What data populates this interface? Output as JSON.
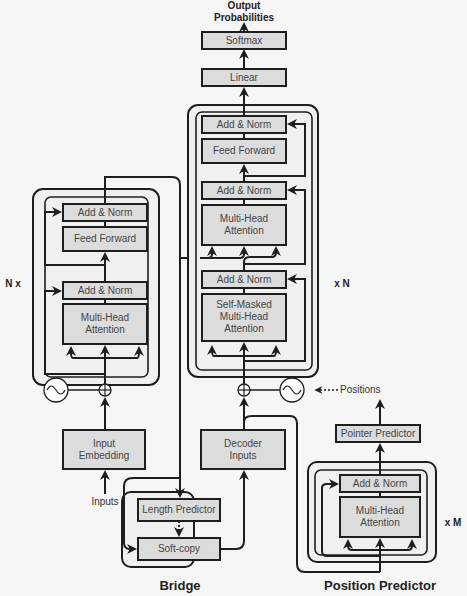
{
  "output": {
    "label_line1": "Output",
    "label_line2": "Probabilities"
  },
  "decoder": {
    "softmax": "Softmax",
    "linear": "Linear",
    "add_norm_top": "Add & Norm",
    "feed_forward": "Feed Forward",
    "add_norm_mid": "Add & Norm",
    "cross_attention_line1": "Multi-Head",
    "cross_attention_line2": "Attention",
    "add_norm_bottom": "Add & Norm",
    "self_attention_line1": "Self-Masked",
    "self_attention_line2": "Multi-Head",
    "self_attention_line3": "Attention",
    "repeat_label": "x N",
    "inputs_line1": "Decoder",
    "inputs_line2": "Inputs"
  },
  "encoder": {
    "add_norm_top": "Add & Norm",
    "feed_forward": "Feed Forward",
    "add_norm_bottom": "Add & Norm",
    "attention_line1": "Multi-Head",
    "attention_line2": "Attention",
    "repeat_label": "N x",
    "embedding_line1": "Input",
    "embedding_line2": "Embedding",
    "inputs_label": "Inputs"
  },
  "bridge": {
    "length_predictor": "Length Predictor",
    "soft_copy": "Soft-copy",
    "title": "Bridge"
  },
  "positions": {
    "label": "Positions"
  },
  "position_predictor": {
    "pointer_predictor": "Pointer Predictor",
    "add_norm": "Add & Norm",
    "attention_line1": "Multi-Head",
    "attention_line2": "Attention",
    "repeat_label": "x M",
    "title": "Position Predictor"
  },
  "colors": {
    "box_fill": "#dcdcdc",
    "container_fill": "#f0f0f0",
    "stroke": "#1e1e1e",
    "background": "#f6f6f6"
  }
}
